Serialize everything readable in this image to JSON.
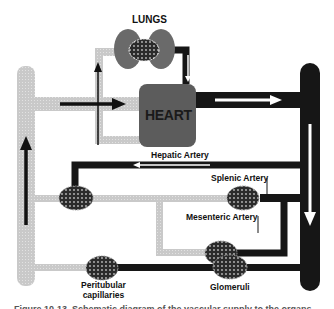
{
  "diagram": {
    "colors": {
      "venous": "#c8c8c8",
      "arterial": "#161616",
      "heart": "#5a5a5a",
      "lungs": "#6a6a6a",
      "capillary_bed": "#2a2a2a",
      "background": "#ffffff"
    },
    "labels": {
      "lungs": "LUNGS",
      "heart": "HEART",
      "hepatic_artery": "Hepatic Artery",
      "splenic_artery": "Splenic Artery",
      "mesenteric_artery": "Mesenteric Artery",
      "peritubular_line1": "Peritubular",
      "peritubular_line2": "capillaries",
      "glomeruli": "Glomeruli"
    },
    "caption": "Figure 10-13. Schematic diagram of the vascular supply to the organs",
    "nodes": [
      {
        "id": "lungs",
        "type": "organ"
      },
      {
        "id": "heart",
        "type": "organ"
      },
      {
        "id": "liver-bed",
        "type": "capillary-bed"
      },
      {
        "id": "spleen-bed",
        "type": "capillary-bed"
      },
      {
        "id": "mesenteric-bed",
        "type": "capillary-bed"
      },
      {
        "id": "peritubular-bed",
        "type": "capillary-bed"
      },
      {
        "id": "glomeruli-bed",
        "type": "capillary-bed"
      }
    ],
    "edges": [
      {
        "from": "vena-cava",
        "to": "heart",
        "kind": "venous"
      },
      {
        "from": "heart",
        "to": "lungs",
        "kind": "venous"
      },
      {
        "from": "lungs",
        "to": "heart",
        "kind": "arterial"
      },
      {
        "from": "heart",
        "to": "aorta",
        "kind": "arterial"
      },
      {
        "from": "aorta",
        "to": "liver-bed",
        "kind": "arterial",
        "label": "Hepatic Artery"
      },
      {
        "from": "aorta",
        "to": "spleen-bed",
        "kind": "arterial",
        "label": "Splenic Artery"
      },
      {
        "from": "aorta",
        "to": "mesenteric-bed",
        "kind": "arterial",
        "label": "Mesenteric Artery"
      },
      {
        "from": "aorta",
        "to": "glomeruli-bed",
        "kind": "arterial"
      },
      {
        "from": "glomeruli-bed",
        "to": "peritubular-bed",
        "kind": "arterial"
      },
      {
        "from": "peritubular-bed",
        "to": "vena-cava",
        "kind": "venous"
      },
      {
        "from": "spleen-bed",
        "to": "liver-bed",
        "kind": "venous"
      },
      {
        "from": "mesenteric-bed",
        "to": "liver-bed",
        "kind": "venous"
      },
      {
        "from": "liver-bed",
        "to": "vena-cava",
        "kind": "venous"
      }
    ]
  }
}
